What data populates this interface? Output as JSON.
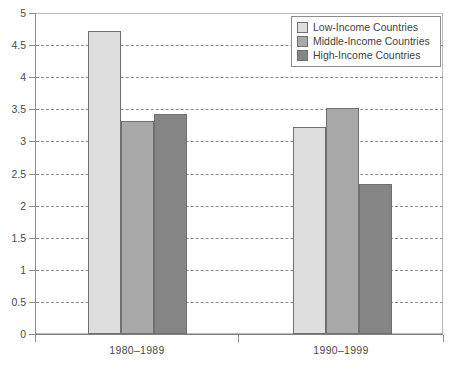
{
  "chart_data": {
    "type": "bar",
    "title": "",
    "subtitle": "",
    "xlabel": "",
    "ylabel": "",
    "categories": [
      "1980–1989",
      "1990–1999"
    ],
    "series": [
      {
        "name": "Low-Income Countries",
        "values": [
          4.72,
          3.22
        ],
        "color": "#dedede"
      },
      {
        "name": "Middle-Income Countries",
        "values": [
          3.31,
          3.52
        ],
        "color": "#a9a9a9"
      },
      {
        "name": "High-Income Countries",
        "values": [
          3.42,
          2.33
        ],
        "color": "#858585"
      }
    ],
    "ylim": [
      0,
      5
    ],
    "yticks": [
      "0",
      "0.5",
      "1",
      "1.5",
      "2",
      "2.5",
      "3",
      "3.5",
      "4",
      "4.5",
      "5"
    ],
    "ytick_values": [
      0,
      0.5,
      1,
      1.5,
      2,
      2.5,
      3,
      3.5,
      4,
      4.5,
      5
    ],
    "grid": true,
    "grid_style": "dashed",
    "legend_position": "top-right",
    "bar_edge_color": "#6f6f6f",
    "grid_color": "#8b8b8b",
    "axis_color": "#8d8d8d"
  },
  "axes": {
    "y_tick_labels": [
      "0",
      "0.5",
      "1",
      "1.5",
      "2",
      "2.5",
      "3",
      "3.5",
      "4",
      "4.5",
      "5"
    ],
    "x_tick_labels": [
      "1980–1989",
      "1990–1999"
    ]
  },
  "legend": {
    "items": [
      {
        "label": "Low-Income Countries",
        "color": "#dedede"
      },
      {
        "label": "Middle-Income Countries",
        "color": "#a9a9a9"
      },
      {
        "label": "High-Income Countries",
        "color": "#858585"
      }
    ]
  }
}
